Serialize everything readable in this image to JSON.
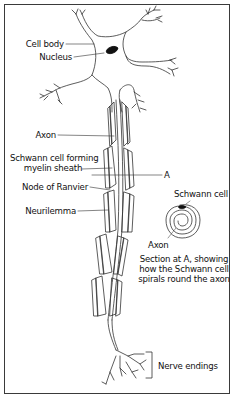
{
  "diagram": {
    "labels": {
      "cell_body": "Cell body",
      "nucleus": "Nucleus",
      "axon": "Axon",
      "schwann_line1": "Schwann cell forming",
      "schwann_line2": "myelin sheath",
      "section_marker": "A",
      "node_of_ranvier": "Node of Ranvier",
      "neurilemma": "Neurilemma",
      "inset_schwann_cell": "Schwann cell",
      "inset_axon": "Axon",
      "caption_line1": "Section at A, showing",
      "caption_line2": "how the Schwann cell",
      "caption_line3": "spirals round the axon",
      "nerve_endings": "Nerve endings"
    },
    "colors": {
      "line": "#333333",
      "background": "#ffffff",
      "nucleus": "#111111"
    }
  }
}
